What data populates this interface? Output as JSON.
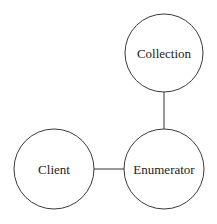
{
  "diagram": {
    "nodes": [
      {
        "id": "collection",
        "label": "Collection",
        "cx": 164,
        "cy": 53,
        "r": 39
      },
      {
        "id": "client",
        "label": "Client",
        "cx": 54,
        "cy": 169,
        "r": 40
      },
      {
        "id": "enumerator",
        "label": "Enumerator",
        "cx": 164,
        "cy": 169,
        "r": 40
      }
    ],
    "edges": [
      {
        "from": "collection",
        "to": "enumerator"
      },
      {
        "from": "client",
        "to": "enumerator"
      }
    ],
    "colors": {
      "stroke": "#3a3a3a",
      "text": "#222222",
      "background": "#ffffff"
    }
  }
}
